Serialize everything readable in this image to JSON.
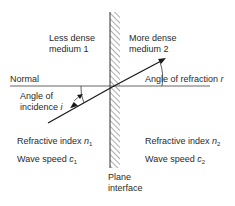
{
  "diagram": {
    "type": "refraction-at-plane-interface",
    "colors": {
      "line": "#1a1a1a",
      "hatch": "#333333",
      "text": "#2a2a2a",
      "background": "#ffffff"
    },
    "labels": {
      "medium1_line1": "Less dense",
      "medium1_line2": "medium 1",
      "medium2_line1": "More dense",
      "medium2_line2": "medium 2",
      "normal": "Normal",
      "angle_incidence_line1": "Angle of",
      "angle_incidence_line2": "incidence",
      "angle_incidence_symbol": "i",
      "angle_refraction": "Angle of refraction",
      "angle_refraction_symbol": "r",
      "refractive_index_1": "Refractive index",
      "refractive_index_1_symbol": "n",
      "refractive_index_1_sub": "1",
      "wave_speed_1": "Wave speed",
      "wave_speed_1_symbol": "c",
      "wave_speed_1_sub": "1",
      "refractive_index_2": "Refractive index",
      "refractive_index_2_symbol": "n",
      "refractive_index_2_sub": "2",
      "wave_speed_2": "Wave speed",
      "wave_speed_2_symbol": "c",
      "wave_speed_2_sub": "2",
      "interface_line1": "Plane",
      "interface_line2": "interface"
    }
  }
}
